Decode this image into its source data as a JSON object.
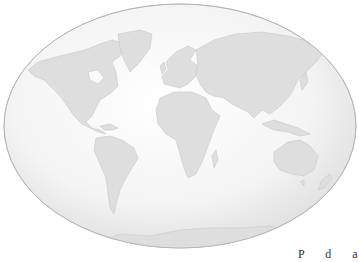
{
  "map": {
    "projection": "oval-world",
    "colors": {
      "ocean_light": "#fafafa",
      "ocean_edge": "#dcdcdc",
      "land": "#dedede",
      "land_stroke": "#c8c8c8",
      "outline": "#b8b8b8"
    },
    "regions": [
      "North America",
      "Greenland",
      "South America",
      "Europe",
      "Africa",
      "Asia",
      "Australia",
      "New Zealand",
      "Antarctica"
    ]
  },
  "caption": {
    "text": "P d a"
  }
}
